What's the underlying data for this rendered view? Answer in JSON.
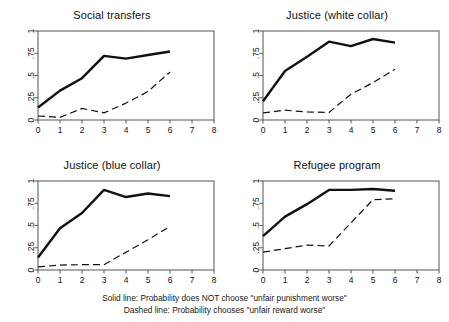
{
  "figure": {
    "caption_lines": [
      "Solid line: Probability does NOT choose \"unfair punishment worse\"",
      "Dashed line: Probability chooses \"unfair reward worse\""
    ],
    "line_color": "#111111",
    "frame_color": "#555555",
    "background": "#ffffff"
  },
  "chart_data": [
    {
      "type": "line",
      "title": "Social transfers",
      "xlabel": "",
      "ylabel": "",
      "xlim": [
        0,
        8
      ],
      "ylim": [
        0,
        1
      ],
      "xticks": [
        0,
        1,
        2,
        3,
        4,
        5,
        6,
        7,
        8
      ],
      "xtick_labels": [
        "0",
        "1",
        "2",
        "3",
        "4",
        "5",
        "6",
        "7",
        "8"
      ],
      "yticks": [
        0,
        0.25,
        0.5,
        0.75,
        1
      ],
      "ytick_labels": [
        "0",
        ".25",
        ".5",
        ".75",
        "1"
      ],
      "grid": false,
      "legend": "below-figure",
      "x": [
        0,
        1,
        2,
        3,
        4,
        5,
        6
      ],
      "series": [
        {
          "name": "Solid line: Probability does NOT choose \"unfair punishment worse\"",
          "style": "solid",
          "values": [
            0.14,
            0.33,
            0.47,
            0.72,
            0.69,
            0.73,
            0.77
          ]
        },
        {
          "name": "Dashed line: Probability chooses \"unfair reward worse\"",
          "style": "dashed",
          "values": [
            0.045,
            0.03,
            0.13,
            0.08,
            0.19,
            0.32,
            0.54
          ]
        }
      ]
    },
    {
      "type": "line",
      "title": "Justice (white collar)",
      "xlabel": "",
      "ylabel": "",
      "xlim": [
        0,
        8
      ],
      "ylim": [
        0,
        1
      ],
      "xticks": [
        0,
        1,
        2,
        3,
        4,
        5,
        6,
        7,
        8
      ],
      "xtick_labels": [
        "0",
        "1",
        "2",
        "3",
        "4",
        "5",
        "6",
        "7",
        "8"
      ],
      "yticks": [
        0,
        0.25,
        0.5,
        0.75,
        1
      ],
      "ytick_labels": [
        "0",
        ".25",
        ".5",
        ".75",
        "1"
      ],
      "grid": false,
      "legend": "below-figure",
      "x": [
        0,
        1,
        2,
        3,
        4,
        5,
        6
      ],
      "series": [
        {
          "name": "Solid line: Probability does NOT choose \"unfair punishment worse\"",
          "style": "solid",
          "values": [
            0.21,
            0.55,
            0.71,
            0.88,
            0.83,
            0.91,
            0.87
          ]
        },
        {
          "name": "Dashed line: Probability chooses \"unfair reward worse\"",
          "style": "dashed",
          "values": [
            0.08,
            0.11,
            0.09,
            0.085,
            0.29,
            0.42,
            0.57
          ]
        }
      ]
    },
    {
      "type": "line",
      "title": "Justice (blue collar)",
      "xlabel": "",
      "ylabel": "",
      "xlim": [
        0,
        8
      ],
      "ylim": [
        0,
        1
      ],
      "xticks": [
        0,
        1,
        2,
        3,
        4,
        5,
        6,
        7,
        8
      ],
      "xtick_labels": [
        "0",
        "1",
        "2",
        "3",
        "4",
        "5",
        "6",
        "7",
        "8"
      ],
      "yticks": [
        0,
        0.25,
        0.5,
        0.75,
        1
      ],
      "ytick_labels": [
        "0",
        ".25",
        ".5",
        ".75",
        "1"
      ],
      "grid": false,
      "legend": "below-figure",
      "x": [
        0,
        1,
        2,
        3,
        4,
        5,
        6
      ],
      "series": [
        {
          "name": "Solid line: Probability does NOT choose \"unfair punishment worse\"",
          "style": "solid",
          "values": [
            0.14,
            0.47,
            0.64,
            0.9,
            0.82,
            0.86,
            0.83
          ]
        },
        {
          "name": "Dashed line: Probability chooses \"unfair reward worse\"",
          "style": "dashed",
          "values": [
            0.035,
            0.055,
            0.06,
            0.06,
            0.2,
            0.34,
            0.49
          ]
        }
      ]
    },
    {
      "type": "line",
      "title": "Refugee program",
      "xlabel": "",
      "ylabel": "",
      "xlim": [
        0,
        8
      ],
      "ylim": [
        0,
        1
      ],
      "xticks": [
        0,
        1,
        2,
        3,
        4,
        5,
        6,
        7,
        8
      ],
      "xtick_labels": [
        "0",
        "1",
        "2",
        "3",
        "4",
        "5",
        "6",
        "7",
        "8"
      ],
      "yticks": [
        0,
        0.25,
        0.5,
        0.75,
        1
      ],
      "ytick_labels": [
        "0",
        ".25",
        ".5",
        ".75",
        "1"
      ],
      "grid": false,
      "legend": "below-figure",
      "x": [
        0,
        1,
        2,
        3,
        4,
        5,
        6
      ],
      "series": [
        {
          "name": "Solid line: Probability does NOT choose \"unfair punishment worse\"",
          "style": "solid",
          "values": [
            0.38,
            0.6,
            0.74,
            0.9,
            0.9,
            0.91,
            0.89
          ]
        },
        {
          "name": "Dashed line: Probability chooses \"unfair reward worse\"",
          "style": "dashed",
          "values": [
            0.2,
            0.24,
            0.28,
            0.27,
            0.53,
            0.79,
            0.8
          ]
        }
      ]
    }
  ]
}
